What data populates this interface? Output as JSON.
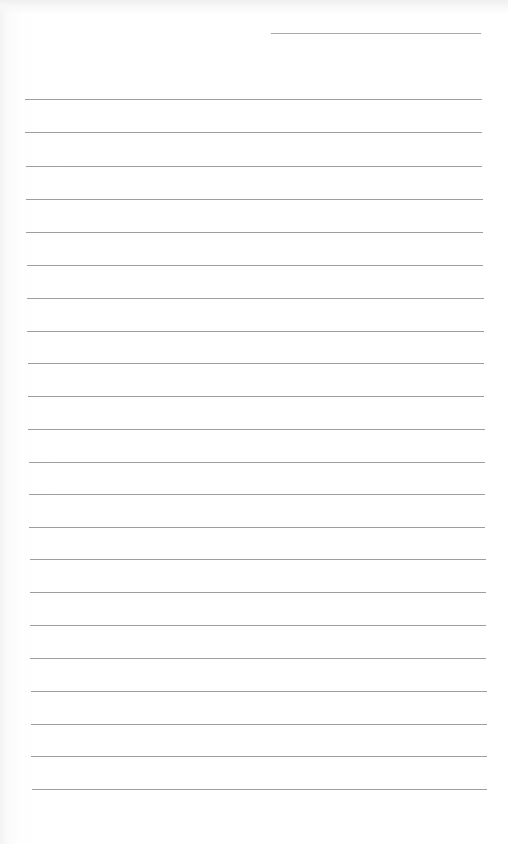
{
  "document": {
    "type": "lined-paper",
    "paper_color": "#ffffff",
    "line_color": "#9e9e9e",
    "date_line": {
      "x1": 271,
      "x2": 481,
      "y": 33
    },
    "rules": [
      {
        "y": 99,
        "x1": 25,
        "x2": 482
      },
      {
        "y": 132,
        "x1": 25,
        "x2": 482
      },
      {
        "y": 166,
        "x1": 26,
        "x2": 482
      },
      {
        "y": 199,
        "x1": 26,
        "x2": 483
      },
      {
        "y": 232,
        "x1": 26,
        "x2": 483
      },
      {
        "y": 265,
        "x1": 27,
        "x2": 483
      },
      {
        "y": 298,
        "x1": 27,
        "x2": 484
      },
      {
        "y": 331,
        "x1": 27,
        "x2": 484
      },
      {
        "y": 363,
        "x1": 28,
        "x2": 484
      },
      {
        "y": 396,
        "x1": 28,
        "x2": 484
      },
      {
        "y": 429,
        "x1": 28,
        "x2": 485
      },
      {
        "y": 462,
        "x1": 29,
        "x2": 485
      },
      {
        "y": 494,
        "x1": 29,
        "x2": 485
      },
      {
        "y": 527,
        "x1": 29,
        "x2": 485
      },
      {
        "y": 559,
        "x1": 30,
        "x2": 486
      },
      {
        "y": 592,
        "x1": 30,
        "x2": 486
      },
      {
        "y": 625,
        "x1": 30,
        "x2": 486
      },
      {
        "y": 658,
        "x1": 30,
        "x2": 486
      },
      {
        "y": 691,
        "x1": 31,
        "x2": 487
      },
      {
        "y": 724,
        "x1": 31,
        "x2": 487
      },
      {
        "y": 756,
        "x1": 31,
        "x2": 487
      },
      {
        "y": 789,
        "x1": 32,
        "x2": 487
      }
    ]
  }
}
